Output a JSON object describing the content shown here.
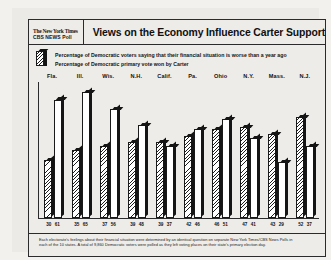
{
  "masthead": {
    "line1": "The New York Times",
    "line2": "CBS NEWS Poll"
  },
  "headline": "Views on the Economy Influence Carter Support",
  "legend": [
    "Percentage of Democratic voters saying that their financial situation is worse than a year ago",
    "Percentage of Democratic primary vote won by Carter"
  ],
  "footnote": {
    "line1": "Each electorate's feelings about their financial situation were determined by an identical question on separate New York Times/CBS News Polls in",
    "line2": "each of the 10 states. A total of 9,860 Democratic voters were polled as they left voting places on their state's primary election day."
  },
  "chart_data": {
    "type": "bar",
    "title": "Views on the Economy Influence Carter Support",
    "categories": [
      "Fla.",
      "Ill.",
      "Wis.",
      "N.H.",
      "Calif.",
      "Pa.",
      "Ohio",
      "N.Y.",
      "Mass.",
      "N.J."
    ],
    "series": [
      {
        "name": "Percentage of Democratic voters saying that their financial situation is worse than a year ago",
        "values": [
          30,
          35,
          37,
          39,
          39,
          42,
          46,
          47,
          43,
          52
        ]
      },
      {
        "name": "Percentage of Democratic primary vote won by Carter",
        "values": [
          61,
          65,
          56,
          48,
          37,
          46,
          51,
          41,
          29,
          37
        ]
      }
    ],
    "xlabel": "",
    "ylabel": "",
    "ylim": [
      0,
      70
    ],
    "grid": false,
    "legend_position": "top"
  }
}
